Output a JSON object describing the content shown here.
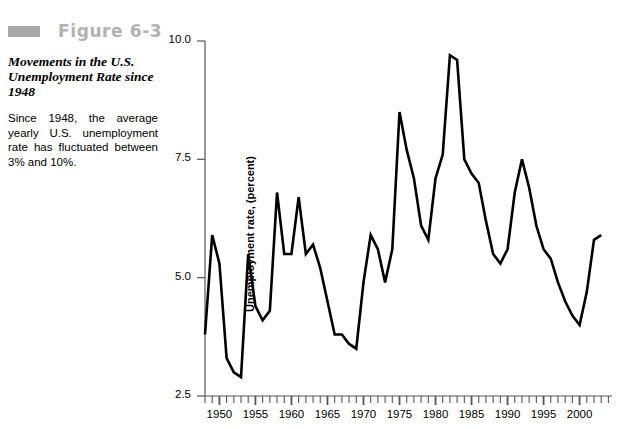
{
  "figure": {
    "label": "Figure 6-3",
    "swatch_color": "#a8a8a8",
    "label_color": "#b2b2b2",
    "title": "Movements in the U.S. Unemployment Rate since 1948",
    "description": "Since 1948, the average yearly U.S. unemployment rate has fluctuated between 3% and 10%."
  },
  "chart_data": {
    "type": "line",
    "title": "",
    "xlabel": "",
    "ylabel": "Unemployment rate, (percent)",
    "ylim": [
      2.5,
      10.0
    ],
    "xlim": [
      1948,
      2003
    ],
    "yticks": [
      2.5,
      5.0,
      7.5,
      10.0
    ],
    "ytick_labels": [
      "2.5",
      "5.0",
      "7.5",
      "10.0"
    ],
    "xticks": [
      1950,
      1955,
      1960,
      1965,
      1970,
      1975,
      1980,
      1985,
      1990,
      1995,
      2000
    ],
    "xtick_labels": [
      "1950",
      "1955",
      "1960",
      "1965",
      "1970",
      "1975",
      "1980",
      "1985",
      "1990",
      "1995",
      "2000"
    ],
    "x_minor_tick_interval": 1,
    "grid": false,
    "legend": false,
    "line_color": "#000000",
    "line_width": 2.6,
    "x": [
      1948,
      1949,
      1950,
      1951,
      1952,
      1953,
      1954,
      1955,
      1956,
      1957,
      1958,
      1959,
      1960,
      1961,
      1962,
      1963,
      1964,
      1965,
      1966,
      1967,
      1968,
      1969,
      1970,
      1971,
      1972,
      1973,
      1974,
      1975,
      1976,
      1977,
      1978,
      1979,
      1980,
      1981,
      1982,
      1983,
      1984,
      1985,
      1986,
      1987,
      1988,
      1989,
      1990,
      1991,
      1992,
      1993,
      1994,
      1995,
      1996,
      1997,
      1998,
      1999,
      2000,
      2001,
      2002,
      2003
    ],
    "values": [
      3.8,
      5.9,
      5.3,
      3.3,
      3.0,
      2.9,
      5.5,
      4.4,
      4.1,
      4.3,
      6.8,
      5.5,
      5.5,
      6.7,
      5.5,
      5.7,
      5.2,
      4.5,
      3.8,
      3.8,
      3.6,
      3.5,
      4.9,
      5.9,
      5.6,
      4.9,
      5.6,
      8.5,
      7.7,
      7.1,
      6.1,
      5.8,
      7.1,
      7.6,
      9.7,
      9.6,
      7.5,
      7.2,
      7.0,
      6.2,
      5.5,
      5.3,
      5.6,
      6.8,
      7.5,
      6.9,
      6.1,
      5.6,
      5.4,
      4.9,
      4.5,
      4.2,
      4.0,
      4.7,
      5.8,
      5.9
    ]
  }
}
